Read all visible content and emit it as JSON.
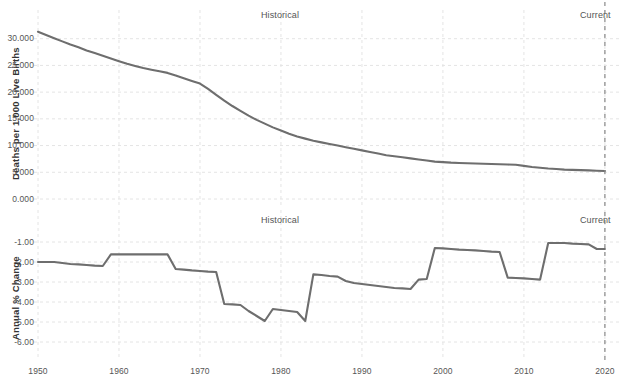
{
  "chart_data": [
    {
      "type": "line",
      "panel": "top",
      "title": "",
      "xlabel": "",
      "ylabel": "Deaths per 1,000 Live Births",
      "xlim": [
        1950,
        2021
      ],
      "ylim": [
        0.0,
        32.0
      ],
      "xticks": [
        1950,
        1960,
        1970,
        1980,
        1990,
        2000,
        2010,
        2020
      ],
      "xticklabels": [
        "1950",
        "1960",
        "1970",
        "1980",
        "1990",
        "2000",
        "2010",
        "2020"
      ],
      "yticks": [
        0.0,
        5.0,
        10.0,
        15.0,
        20.0,
        25.0,
        30.0
      ],
      "yticklabels": [
        "0.000",
        "5.000",
        "10.000",
        "15.000",
        "20.000",
        "25.000",
        "30.000"
      ],
      "grid": true,
      "legend": "none",
      "annotations": [
        {
          "text": "Historical",
          "x": 1980,
          "position": "top-center"
        },
        {
          "text": "Current",
          "x": 2020,
          "position": "top-right"
        }
      ],
      "reference_line": {
        "label": "Current",
        "x": 2020,
        "style": "dashed"
      },
      "line_color": "#6e6e6e",
      "x": [
        1950,
        1951,
        1952,
        1953,
        1954,
        1955,
        1956,
        1957,
        1958,
        1959,
        1960,
        1961,
        1962,
        1963,
        1964,
        1965,
        1966,
        1967,
        1968,
        1969,
        1970,
        1971,
        1972,
        1973,
        1974,
        1975,
        1976,
        1977,
        1978,
        1979,
        1980,
        1981,
        1982,
        1983,
        1984,
        1985,
        1986,
        1987,
        1988,
        1989,
        1990,
        1991,
        1992,
        1993,
        1994,
        1995,
        1996,
        1997,
        1998,
        1999,
        2000,
        2001,
        2002,
        2003,
        2004,
        2005,
        2006,
        2007,
        2008,
        2009,
        2010,
        2011,
        2012,
        2013,
        2014,
        2015,
        2016,
        2017,
        2018,
        2019,
        2020
      ],
      "y": [
        31.3,
        30.7,
        30.1,
        29.5,
        28.9,
        28.4,
        27.8,
        27.3,
        26.8,
        26.3,
        25.8,
        25.3,
        24.9,
        24.5,
        24.2,
        23.9,
        23.6,
        23.1,
        22.6,
        22.1,
        21.6,
        20.6,
        19.5,
        18.4,
        17.4,
        16.5,
        15.6,
        14.8,
        14.1,
        13.4,
        12.8,
        12.2,
        11.7,
        11.3,
        10.9,
        10.6,
        10.3,
        10.0,
        9.7,
        9.4,
        9.1,
        8.8,
        8.5,
        8.2,
        8.0,
        7.8,
        7.6,
        7.4,
        7.2,
        7.0,
        6.9,
        6.8,
        6.75,
        6.7,
        6.65,
        6.6,
        6.55,
        6.5,
        6.45,
        6.4,
        6.2,
        6.0,
        5.85,
        5.7,
        5.6,
        5.5,
        5.45,
        5.4,
        5.35,
        5.3,
        5.25
      ]
    },
    {
      "type": "line",
      "panel": "bottom",
      "title": "",
      "xlabel": "",
      "ylabel": "Annual % Change",
      "xlim": [
        1950,
        2021
      ],
      "ylim": [
        -6.5,
        -0.3
      ],
      "xticks": [
        1950,
        1960,
        1970,
        1980,
        1990,
        2000,
        2010,
        2020
      ],
      "xticklabels": [
        "1950",
        "1960",
        "1970",
        "1980",
        "1990",
        "2000",
        "2010",
        "2020"
      ],
      "yticks": [
        -6.0,
        -5.0,
        -4.0,
        -3.0,
        -2.0,
        -1.0
      ],
      "yticklabels": [
        "-6.00",
        "-5.00",
        "-4.00",
        "-3.00",
        "-2.00",
        "-1.00"
      ],
      "grid": true,
      "legend": "none",
      "annotations": [
        {
          "text": "Historical",
          "x": 1980,
          "position": "top-center"
        },
        {
          "text": "Current",
          "x": 2020,
          "position": "top-right"
        }
      ],
      "reference_line": {
        "label": "Current",
        "x": 2020,
        "style": "dashed"
      },
      "line_color": "#6e6e6e",
      "x": [
        1950,
        1951,
        1952,
        1953,
        1954,
        1955,
        1956,
        1957,
        1958,
        1959,
        1960,
        1961,
        1962,
        1963,
        1964,
        1965,
        1966,
        1967,
        1968,
        1969,
        1970,
        1971,
        1972,
        1973,
        1974,
        1975,
        1976,
        1977,
        1978,
        1979,
        1980,
        1981,
        1982,
        1983,
        1984,
        1985,
        1986,
        1987,
        1988,
        1989,
        1990,
        1991,
        1992,
        1993,
        1994,
        1995,
        1996,
        1997,
        1998,
        1999,
        2000,
        2001,
        2002,
        2003,
        2004,
        2005,
        2006,
        2007,
        2008,
        2009,
        2010,
        2011,
        2012,
        2013,
        2014,
        2015,
        2016,
        2017,
        2018,
        2019,
        2020
      ],
      "y": [
        -2.0,
        -2.0,
        -2.0,
        -2.05,
        -2.1,
        -2.12,
        -2.15,
        -2.18,
        -2.2,
        -1.62,
        -1.62,
        -1.62,
        -1.62,
        -1.62,
        -1.62,
        -1.62,
        -1.62,
        -2.35,
        -2.38,
        -2.42,
        -2.45,
        -2.48,
        -2.5,
        -4.1,
        -4.12,
        -4.15,
        -4.45,
        -4.7,
        -4.95,
        -4.35,
        -4.4,
        -4.45,
        -4.5,
        -4.95,
        -2.62,
        -2.65,
        -2.7,
        -2.73,
        -2.95,
        -3.05,
        -3.1,
        -3.15,
        -3.2,
        -3.25,
        -3.3,
        -3.32,
        -3.35,
        -2.88,
        -2.85,
        -1.3,
        -1.32,
        -1.35,
        -1.38,
        -1.4,
        -1.42,
        -1.45,
        -1.48,
        -1.5,
        -2.78,
        -2.8,
        -2.82,
        -2.85,
        -2.88,
        -1.05,
        -1.05,
        -1.05,
        -1.08,
        -1.1,
        -1.12,
        -1.35,
        -1.35
      ]
    }
  ],
  "panels": {
    "top": {
      "ylabel": "Deaths per 1,000 Live Births",
      "annotation_historical": "Historical",
      "annotation_current": "Current",
      "ytick_labels": [
        "30.000",
        "25.000",
        "20.000",
        "15.000",
        "10.000",
        "5.000",
        "0.000"
      ]
    },
    "bottom": {
      "ylabel": "Annual % Change",
      "annotation_historical": "Historical",
      "annotation_current": "Current",
      "ytick_labels": [
        "-1.00",
        "-2.00",
        "-3.00",
        "-4.00",
        "-5.00",
        "-6.00"
      ],
      "xtick_labels": [
        "1950",
        "1960",
        "1970",
        "1980",
        "1990",
        "2000",
        "2010",
        "2020"
      ]
    }
  },
  "colors": {
    "line": "#6e6e6e",
    "grid": "#e4e4e4",
    "reference_line": "#8a8a8a",
    "text": "#555555",
    "axis_label_text": "#333333",
    "background": "#ffffff"
  }
}
